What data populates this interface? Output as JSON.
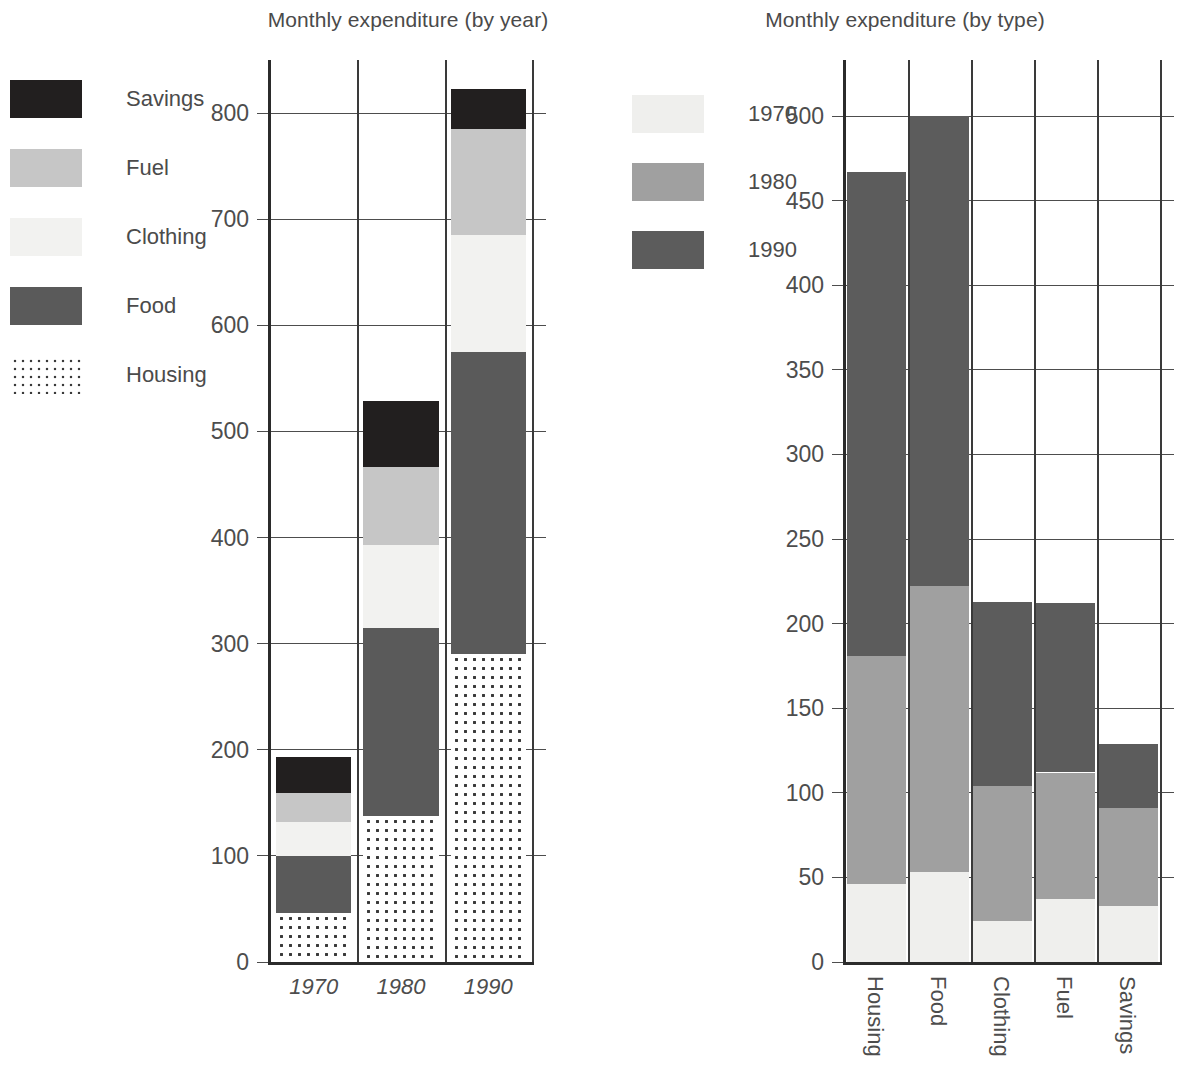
{
  "left_chart": {
    "title": "Monthly expenditure (by year)",
    "legend": {
      "items": [
        {
          "label": "Savings",
          "swatch": "savings-swatch",
          "color": "#221f1f",
          "fill": "solid-dark"
        },
        {
          "label": "Fuel",
          "swatch": "fuel-swatch",
          "color": "#c6c6c6",
          "fill": "solid-light-gray"
        },
        {
          "label": "Clothing",
          "swatch": "clothing-swatch",
          "color": "#f2f2f0",
          "fill": "solid-near-white"
        },
        {
          "label": "Food",
          "swatch": "food-swatch",
          "color": "#5a5a5a",
          "fill": "solid-mid-gray"
        },
        {
          "label": "Housing",
          "swatch": "housing-swatch",
          "color": "#3a3a3a",
          "fill": "dotted-pattern"
        }
      ]
    },
    "y_ticks": [
      "0",
      "100",
      "200",
      "300",
      "400",
      "500",
      "600",
      "700",
      "800"
    ],
    "x_ticks": [
      "1970",
      "1980",
      "1990"
    ]
  },
  "right_chart": {
    "title": "Monthly expenditure (by type)",
    "legend": {
      "items": [
        {
          "label": "1970",
          "swatch": "year-1970-swatch",
          "color": "#efefed"
        },
        {
          "label": "1980",
          "swatch": "year-1980-swatch",
          "color": "#a0a0a0"
        },
        {
          "label": "1990",
          "swatch": "year-1990-swatch",
          "color": "#5c5c5c"
        }
      ]
    },
    "y_ticks": [
      "0",
      "50",
      "100",
      "150",
      "200",
      "250",
      "300",
      "350",
      "400",
      "450",
      "500"
    ],
    "x_ticks": [
      "Housing",
      "Food",
      "Clothing",
      "Fuel",
      "Savings"
    ]
  },
  "chart_data": [
    {
      "type": "bar",
      "subtype": "stacked-vertical",
      "title": "Monthly expenditure (by year)",
      "xlabel": "",
      "ylabel": "",
      "ylim": [
        0,
        850
      ],
      "ytick_values": [
        0,
        100,
        200,
        300,
        400,
        500,
        600,
        700,
        800
      ],
      "grid": true,
      "grid_axis": "y",
      "legend_position": "left-outside",
      "categories": [
        "1970",
        "1980",
        "1990"
      ],
      "stack_order_bottom_to_top": [
        "Housing",
        "Food",
        "Clothing",
        "Fuel",
        "Savings"
      ],
      "series": [
        {
          "name": "Housing",
          "values": [
            46,
            138,
            290
          ],
          "color": "#3a3a3a",
          "fill": "dotted"
        },
        {
          "name": "Food",
          "values": [
            54,
            177,
            285
          ],
          "color": "#5a5a5a",
          "fill": "solid"
        },
        {
          "name": "Clothing",
          "values": [
            32,
            78,
            110
          ],
          "color": "#f2f2f0",
          "fill": "solid"
        },
        {
          "name": "Fuel",
          "values": [
            27,
            73,
            100
          ],
          "color": "#c6c6c6",
          "fill": "solid"
        },
        {
          "name": "Savings",
          "values": [
            34,
            63,
            38
          ],
          "color": "#221f1f",
          "fill": "solid"
        }
      ],
      "totals": [
        193,
        529,
        823
      ]
    },
    {
      "type": "bar",
      "subtype": "stacked-vertical",
      "title": "Monthly expenditure (by type)",
      "xlabel": "",
      "ylabel": "",
      "ylim": [
        0,
        515
      ],
      "ytick_values": [
        0,
        50,
        100,
        150,
        200,
        250,
        300,
        350,
        400,
        450,
        500
      ],
      "grid": true,
      "grid_axis": "y",
      "legend_position": "left-outside",
      "categories": [
        "Housing",
        "Food",
        "Clothing",
        "Fuel",
        "Savings"
      ],
      "stack_order_bottom_to_top": [
        "1970",
        "1980",
        "1990"
      ],
      "series": [
        {
          "name": "1970",
          "values": [
            46,
            53,
            24,
            37,
            33
          ],
          "color": "#efefed"
        },
        {
          "name": "1980",
          "values": [
            135,
            169,
            80,
            75,
            58
          ],
          "color": "#a0a0a0"
        },
        {
          "name": "1990",
          "values": [
            286,
            278,
            109,
            100,
            38
          ],
          "color": "#5c5c5c"
        }
      ],
      "totals": [
        467,
        500,
        213,
        212,
        129
      ]
    }
  ]
}
